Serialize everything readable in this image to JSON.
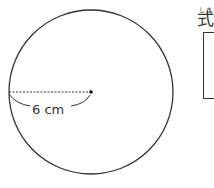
{
  "figure": {
    "shape": "circle",
    "radius_label": "6 cm",
    "center": [
      91,
      92
    ],
    "radius_px": 82,
    "line_color": "#333333"
  },
  "answer_section": {
    "label": "式",
    "label_reading": "しき"
  }
}
